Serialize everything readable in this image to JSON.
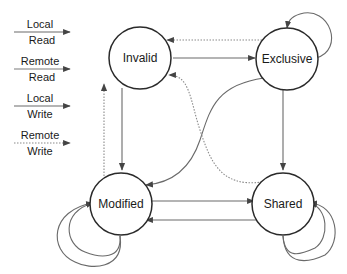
{
  "diagram": {
    "type": "state-machine",
    "title": "",
    "legend": [
      {
        "id": "local_read",
        "line1": "Local",
        "line2": "Read",
        "style": "solid"
      },
      {
        "id": "remote_read",
        "line1": "Remote",
        "line2": "Read",
        "style": "solid-light"
      },
      {
        "id": "local_write",
        "line1": "Local",
        "line2": "Write",
        "style": "solid"
      },
      {
        "id": "remote_write",
        "line1": "Remote",
        "line2": "Write",
        "style": "dotted"
      }
    ],
    "states": [
      {
        "id": "invalid",
        "label": "Invalid"
      },
      {
        "id": "exclusive",
        "label": "Exclusive"
      },
      {
        "id": "modified",
        "label": "Modified"
      },
      {
        "id": "shared",
        "label": "Shared"
      }
    ],
    "transitions": [
      {
        "from": "invalid",
        "to": "exclusive",
        "style": "solid"
      },
      {
        "from": "exclusive",
        "to": "invalid",
        "style": "dotted"
      },
      {
        "from": "exclusive",
        "to": "exclusive",
        "style": "solid",
        "self_loop": true
      },
      {
        "from": "invalid",
        "to": "modified",
        "style": "solid"
      },
      {
        "from": "modified",
        "to": "invalid",
        "style": "dotted"
      },
      {
        "from": "exclusive",
        "to": "modified",
        "style": "solid"
      },
      {
        "from": "shared",
        "to": "invalid",
        "style": "dotted"
      },
      {
        "from": "exclusive",
        "to": "shared",
        "style": "solid"
      },
      {
        "from": "modified",
        "to": "shared",
        "style": "solid"
      },
      {
        "from": "shared",
        "to": "modified",
        "style": "solid"
      },
      {
        "from": "modified",
        "to": "modified",
        "style": "solid",
        "self_loop": true,
        "count": 2
      },
      {
        "from": "shared",
        "to": "shared",
        "style": "solid",
        "self_loop": true,
        "count": 2
      }
    ],
    "colors": {
      "node_stroke": "#2a2a2a",
      "edge": "#6a6a6a",
      "background": "#ffffff"
    }
  }
}
